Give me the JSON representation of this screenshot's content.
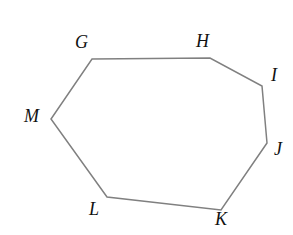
{
  "figure": {
    "kind": "polygon",
    "name": "heptagon-ghijklm",
    "background_color": "#ffffff",
    "stroke_color": "#808080",
    "stroke_width": 1.5,
    "label_color": "#111111",
    "label_font_size": 18,
    "canvas": {
      "width": 293,
      "height": 235
    },
    "vertices": [
      {
        "id": "G",
        "label": "G",
        "x": 92,
        "y": 59,
        "label_x": 75,
        "label_y": 33
      },
      {
        "id": "H",
        "label": "H",
        "x": 210,
        "y": 58,
        "label_x": 196,
        "label_y": 32
      },
      {
        "id": "I",
        "label": "I",
        "x": 262,
        "y": 86,
        "label_x": 271,
        "label_y": 66
      },
      {
        "id": "J",
        "label": "J",
        "x": 267,
        "y": 143,
        "label_x": 274,
        "label_y": 140
      },
      {
        "id": "K",
        "label": "K",
        "x": 221,
        "y": 210,
        "label_x": 215,
        "label_y": 210
      },
      {
        "id": "L",
        "label": "L",
        "x": 107,
        "y": 197,
        "label_x": 89,
        "label_y": 200
      },
      {
        "id": "M",
        "label": "M",
        "x": 51,
        "y": 119,
        "label_x": 24,
        "label_y": 107
      }
    ],
    "path_points": "92,59 210,58 262,86 267,143 221,210 107,197 51,119"
  }
}
